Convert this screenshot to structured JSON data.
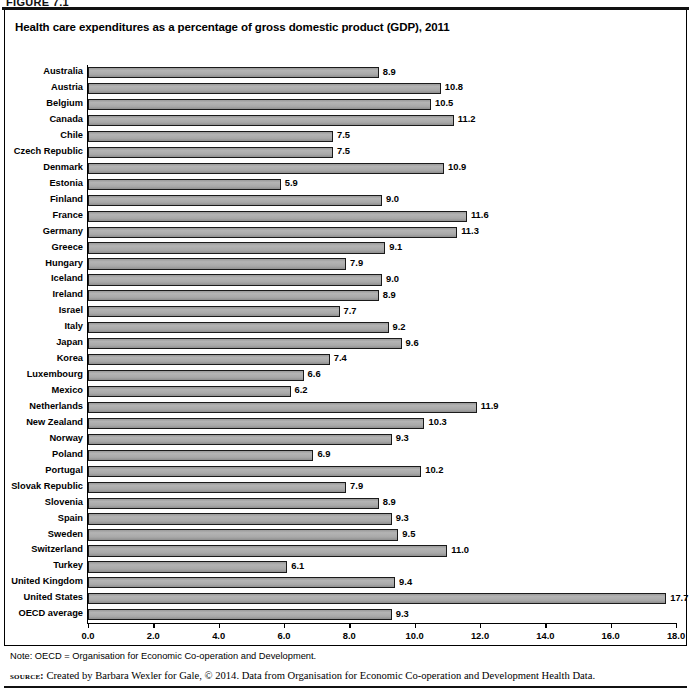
{
  "figure": {
    "number": "FIGURE 7.1",
    "title": "Health care expenditures as a percentage of gross domestic product (GDP), 2011",
    "note": "Note: OECD = Organisation for Economic Co-operation and Development.",
    "source_label": "source:",
    "source_text": "Created by Barbara Wexler for Gale, © 2014. Data from Organisation for Economic Co-operation and Development Health Data."
  },
  "style": {
    "bar_fill": "#a9a9a9",
    "bar_border": "#1a1a1a",
    "text_color": "#000000",
    "background": "#ffffff"
  },
  "chart_data": {
    "type": "bar",
    "orientation": "horizontal",
    "title": "Health care expenditures as a percentage of gross domestic product (GDP), 2011",
    "xlabel": "",
    "ylabel": "",
    "xlim": [
      0.0,
      18.0
    ],
    "xticks": [
      "0.0",
      "2.0",
      "4.0",
      "6.0",
      "8.0",
      "10.0",
      "12.0",
      "14.0",
      "16.0",
      "18.0"
    ],
    "xtick_values": [
      0,
      2,
      4,
      6,
      8,
      10,
      12,
      14,
      16,
      18
    ],
    "grid": false,
    "legend": "none",
    "value_label_format": "one-decimal",
    "categories": [
      "Australia",
      "Austria",
      "Belgium",
      "Canada",
      "Chile",
      "Czech Republic",
      "Denmark",
      "Estonia",
      "Finland",
      "France",
      "Germany",
      "Greece",
      "Hungary",
      "Iceland",
      "Ireland",
      "Israel",
      "Italy",
      "Japan",
      "Korea",
      "Luxembourg",
      "Mexico",
      "Netherlands",
      "New Zealand",
      "Norway",
      "Poland",
      "Portugal",
      "Slovak Republic",
      "Slovenia",
      "Spain",
      "Sweden",
      "Switzerland",
      "Turkey",
      "United Kingdom",
      "United States",
      "OECD average"
    ],
    "values": [
      8.9,
      10.8,
      10.5,
      11.2,
      7.5,
      7.5,
      10.9,
      5.9,
      9.0,
      11.6,
      11.3,
      9.1,
      7.9,
      9.0,
      8.9,
      7.7,
      9.2,
      9.6,
      7.4,
      6.6,
      6.2,
      11.9,
      10.3,
      9.3,
      6.9,
      10.2,
      7.9,
      8.9,
      9.3,
      9.5,
      11.0,
      6.1,
      9.4,
      17.7,
      9.3
    ],
    "value_labels": [
      "8.9",
      "10.8",
      "10.5",
      "11.2",
      "7.5",
      "7.5",
      "10.9",
      "5.9",
      "9.0",
      "11.6",
      "11.3",
      "9.1",
      "7.9",
      "9.0",
      "8.9",
      "7.7",
      "9.2",
      "9.6",
      "7.4",
      "6.6",
      "6.2",
      "11.9",
      "10.3",
      "9.3",
      "6.9",
      "10.2",
      "7.9",
      "8.9",
      "9.3",
      "9.5",
      "11.0",
      "6.1",
      "9.4",
      "17.7",
      "9.3"
    ]
  }
}
